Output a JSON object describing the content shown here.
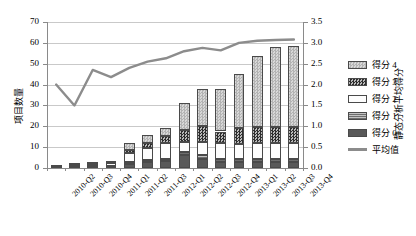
{
  "chart_data": {
    "type": "bar",
    "subtype": "stacked-bar-with-line",
    "title": "",
    "xlabel": "",
    "ylabel": "项目数量",
    "y2label": "静态分析平均得分",
    "categories": [
      "2010-Q2",
      "2010-Q3",
      "2010-Q4",
      "2011-Q1",
      "2011-Q2",
      "2011-Q3",
      "2012-Q1",
      "2012-Q2",
      "2012-Q3",
      "2012-Q4",
      "2013-Q1",
      "2013-Q2",
      "2013-Q3",
      "2013-Q4"
    ],
    "ylim": [
      0,
      70
    ],
    "yticks": [
      0,
      10,
      20,
      30,
      40,
      50,
      60,
      70
    ],
    "y2lim": [
      0.0,
      3.5
    ],
    "y2ticks": [
      "0.0",
      "0.5",
      "1.0",
      "1.5",
      "2.0",
      "2.5",
      "3.0",
      "3.5"
    ],
    "grid": true,
    "legend_position": "right",
    "series": [
      {
        "name": "得分 0",
        "pattern": "solid-dark-gray",
        "color": "#595959",
        "values": [
          0.3,
          0.4,
          0.5,
          0.6,
          2.0,
          3.0,
          3.5,
          6.0,
          4.5,
          3.0,
          3.0,
          3.0,
          3.0,
          3.0
        ]
      },
      {
        "name": "得分 1",
        "pattern": "horizontal-lines",
        "color": "#8e8e8e",
        "values": [
          0.2,
          0.3,
          0.4,
          0.5,
          0.8,
          1.0,
          1.0,
          1.5,
          1.5,
          1.5,
          1.5,
          1.5,
          1.5,
          1.5
        ]
      },
      {
        "name": "得分 2",
        "pattern": "white",
        "color": "#fdfdfd",
        "values": [
          0.5,
          0.8,
          1.1,
          1.4,
          4.2,
          5.5,
          7.5,
          5.0,
          6.5,
          7.5,
          7.0,
          7.5,
          7.5,
          7.5
        ]
      },
      {
        "name": "得分 3",
        "pattern": "dark-checker",
        "color": "#2e2e2e",
        "values": [
          0.0,
          0.0,
          0.0,
          0.0,
          1.5,
          2.5,
          3.5,
          5.5,
          7.5,
          5.5,
          7.5,
          7.5,
          7.5,
          7.5
        ]
      },
      {
        "name": "得分 4",
        "pattern": "light-checker",
        "color": "#c8c8c8",
        "values": [
          0.0,
          0.5,
          0.5,
          1.0,
          3.5,
          4.0,
          3.5,
          13.0,
          18.0,
          20.5,
          26.0,
          34.0,
          38.5,
          39.0
        ]
      }
    ],
    "line_series": {
      "name": "平均值",
      "color": "#8c8c8c",
      "axis": "right",
      "values": [
        2.0,
        1.5,
        2.35,
        2.18,
        2.4,
        2.55,
        2.63,
        2.8,
        2.88,
        2.82,
        3.0,
        3.05,
        3.07,
        3.08
      ]
    },
    "bar_totals": [
      1,
      2,
      2.5,
      3.5,
      12,
      16,
      19,
      31,
      38,
      38,
      45,
      53.5,
      58,
      58.5
    ],
    "legend_entries": [
      "得分 4",
      "得分 3",
      "得分 2",
      "得分 1",
      "得分 0",
      "平均值"
    ]
  }
}
